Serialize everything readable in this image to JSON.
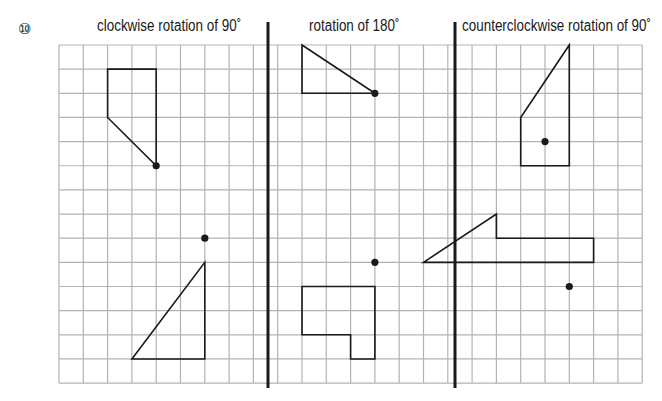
{
  "problem": {
    "number": "⑩"
  },
  "panels": [
    {
      "title": "clockwise rotation of 90˚"
    },
    {
      "title": "rotation of 180˚"
    },
    {
      "title": "counterclockwise rotation of 90˚"
    }
  ],
  "grid": {
    "columns": 24,
    "rows": 14,
    "line_color": "#b3b3b3",
    "shape_color": "#1a1a1a",
    "divider_color": "#1a1a1a"
  },
  "figures": {
    "panel1": {
      "upper_shape": [
        [
          2,
          1
        ],
        [
          4,
          1
        ],
        [
          4,
          5
        ],
        [
          2,
          3
        ]
      ],
      "upper_center": [
        4,
        5
      ],
      "lower_shape": [
        [
          3,
          13
        ],
        [
          6,
          9
        ],
        [
          6,
          13
        ]
      ],
      "lower_center": [
        6,
        8
      ]
    },
    "panel2": {
      "upper_shape": [
        [
          10,
          0
        ],
        [
          13,
          2
        ],
        [
          10,
          2
        ]
      ],
      "upper_center": [
        13,
        2
      ],
      "lower_shape": [
        [
          10,
          10
        ],
        [
          13,
          10
        ],
        [
          13,
          13
        ],
        [
          12,
          13
        ],
        [
          12,
          12
        ],
        [
          10,
          12
        ]
      ],
      "lower_center": [
        13,
        9
      ]
    },
    "panel3": {
      "upper_shape": [
        [
          21,
          0
        ],
        [
          21,
          5
        ],
        [
          19,
          5
        ],
        [
          19,
          3
        ]
      ],
      "upper_center": [
        20,
        4
      ],
      "lower_shape": [
        [
          18,
          7
        ],
        [
          18,
          8
        ],
        [
          22,
          8
        ],
        [
          22,
          9
        ],
        [
          15,
          9
        ]
      ],
      "lower_center": [
        21,
        10
      ]
    }
  }
}
